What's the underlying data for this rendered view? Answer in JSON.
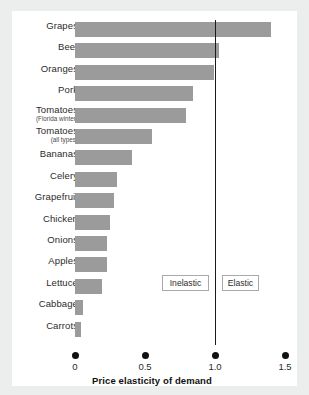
{
  "chart_data": {
    "type": "bar",
    "orientation": "horizontal",
    "title": "",
    "xlabel": "Price elasticity of demand",
    "ylabel": "",
    "xlim": [
      0,
      1.5
    ],
    "xticks": [
      "0",
      "0.5",
      "1.0",
      "1.5"
    ],
    "xtick_values": [
      0,
      0.5,
      1.0,
      1.5
    ],
    "grid": false,
    "legend": "none",
    "bar_color": "#9b9b9b",
    "reference_line": {
      "value": 1.0,
      "label": "unit elastic",
      "color": "#1a1a1a"
    },
    "annotations": [
      {
        "text": "Inelastic",
        "region": "left-of-1.0"
      },
      {
        "text": "Elastic",
        "region": "right-of-1.0"
      }
    ],
    "categories": [
      "Grapes",
      "Beef",
      "Oranges",
      "Tomatoes (Florida winter)",
      "Pork",
      "Tomatoes (all types)",
      "Bananas",
      "Celery",
      "Grapefruit",
      "Chicken",
      "Onions",
      "Apples",
      "Lettuce",
      "Cabbage",
      "Carrots"
    ],
    "values": [
      1.4,
      1.03,
      0.99,
      0.84,
      0.79,
      0.55,
      0.41,
      0.3,
      0.28,
      0.25,
      0.23,
      0.23,
      0.19,
      0.06,
      0.04
    ]
  },
  "bars": [
    {
      "label": "Grapes",
      "sub": "",
      "value": 1.4
    },
    {
      "label": "Beef",
      "sub": "",
      "value": 1.03
    },
    {
      "label": "Oranges",
      "sub": "",
      "value": 0.99
    },
    {
      "label": "Pork",
      "sub": "",
      "value": 0.84
    },
    {
      "label": "Tomatoes",
      "sub": "(Florida winter)",
      "value": 0.79
    },
    {
      "label": "Tomatoes",
      "sub": "(all types)",
      "value": 0.55
    },
    {
      "label": "Bananas",
      "sub": "",
      "value": 0.41
    },
    {
      "label": "Celery",
      "sub": "",
      "value": 0.3
    },
    {
      "label": "Grapefruit",
      "sub": "",
      "value": 0.28
    },
    {
      "label": "Chicken",
      "sub": "",
      "value": 0.25
    },
    {
      "label": "Onions",
      "sub": "",
      "value": 0.23
    },
    {
      "label": "Apples",
      "sub": "",
      "value": 0.23
    },
    {
      "label": "Lettuce",
      "sub": "",
      "value": 0.19
    },
    {
      "label": "Cabbage",
      "sub": "",
      "value": 0.06
    },
    {
      "label": "Carrots",
      "sub": "",
      "value": 0.04
    }
  ],
  "axis": {
    "title": "Price elasticity of demand",
    "ticks": [
      {
        "label": "0",
        "value": 0
      },
      {
        "label": "0.5",
        "value": 0.5
      },
      {
        "label": "1.0",
        "value": 1.0
      },
      {
        "label": "1.5",
        "value": 1.5
      }
    ]
  },
  "regions": {
    "inelastic_label": "Inelastic",
    "elastic_label": "Elastic"
  },
  "colors": {
    "bar": "#9b9b9b",
    "line": "#1a1a1a",
    "panel": "#ffffff",
    "background": "#eceded",
    "text": "#2b2b2b"
  }
}
